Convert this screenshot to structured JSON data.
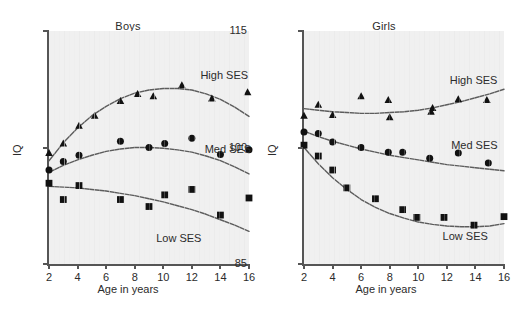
{
  "figure": {
    "background": "#ffffff",
    "plot_background": "#f0f0f0",
    "axis_color": "#555555",
    "curve_color": "#5c5c5c",
    "marker_color": "#111111"
  },
  "chart_data": [
    {
      "type": "scatter",
      "title": "Boys",
      "xlabel": "Age in years",
      "ylabel": "IQ",
      "xlim": [
        2,
        16
      ],
      "ylim": [
        85,
        115
      ],
      "xticks": [
        2,
        4,
        6,
        8,
        10,
        12,
        14,
        16
      ],
      "yticks": [
        85,
        100,
        115
      ],
      "grid": false,
      "legend_position": "inline-right",
      "series": [
        {
          "name": "High SES",
          "marker": "triangle",
          "label": "High SES",
          "label_x": 12.6,
          "label_y": 109.2,
          "points": [
            {
              "x": 2.0,
              "y": 99.3
            },
            {
              "x": 3.0,
              "y": 100.5
            },
            {
              "x": 4.1,
              "y": 102.8
            },
            {
              "x": 5.2,
              "y": 104.1
            },
            {
              "x": 7.0,
              "y": 106.0
            },
            {
              "x": 8.2,
              "y": 106.9
            },
            {
              "x": 9.3,
              "y": 106.6
            },
            {
              "x": 11.3,
              "y": 108.0
            },
            {
              "x": 13.4,
              "y": 106.3
            },
            {
              "x": 15.9,
              "y": 107.1
            }
          ],
          "fit": [
            {
              "x": 2.0,
              "y": 98.3
            },
            {
              "x": 3.0,
              "y": 100.6
            },
            {
              "x": 4.0,
              "y": 102.5
            },
            {
              "x": 5.0,
              "y": 104.1
            },
            {
              "x": 6.0,
              "y": 105.3
            },
            {
              "x": 7.0,
              "y": 106.3
            },
            {
              "x": 8.0,
              "y": 107.0
            },
            {
              "x": 9.0,
              "y": 107.4
            },
            {
              "x": 10.0,
              "y": 107.6
            },
            {
              "x": 11.0,
              "y": 107.6
            },
            {
              "x": 12.0,
              "y": 107.4
            },
            {
              "x": 13.0,
              "y": 106.9
            },
            {
              "x": 14.0,
              "y": 106.2
            },
            {
              "x": 15.0,
              "y": 105.2
            },
            {
              "x": 16.0,
              "y": 104.0
            }
          ]
        },
        {
          "name": "Med SES",
          "marker": "circle",
          "label": "Med SES",
          "label_x": 12.9,
          "label_y": 99.7,
          "points": [
            {
              "x": 2.0,
              "y": 97.1
            },
            {
              "x": 3.0,
              "y": 98.2
            },
            {
              "x": 4.1,
              "y": 99.0
            },
            {
              "x": 7.0,
              "y": 100.8
            },
            {
              "x": 9.0,
              "y": 100.0
            },
            {
              "x": 10.1,
              "y": 100.5
            },
            {
              "x": 12.0,
              "y": 101.2
            },
            {
              "x": 14.0,
              "y": 99.1
            },
            {
              "x": 16.0,
              "y": 99.7
            }
          ],
          "fit": [
            {
              "x": 2.0,
              "y": 96.8
            },
            {
              "x": 3.0,
              "y": 97.7
            },
            {
              "x": 4.0,
              "y": 98.4
            },
            {
              "x": 5.0,
              "y": 99.0
            },
            {
              "x": 6.0,
              "y": 99.5
            },
            {
              "x": 7.0,
              "y": 99.8
            },
            {
              "x": 8.0,
              "y": 100.0
            },
            {
              "x": 9.0,
              "y": 100.0
            },
            {
              "x": 10.0,
              "y": 99.9
            },
            {
              "x": 11.0,
              "y": 99.7
            },
            {
              "x": 12.0,
              "y": 99.4
            },
            {
              "x": 13.0,
              "y": 98.9
            },
            {
              "x": 14.0,
              "y": 98.3
            },
            {
              "x": 15.0,
              "y": 97.5
            },
            {
              "x": 16.0,
              "y": 96.6
            }
          ]
        },
        {
          "name": "Low SES",
          "marker": "square",
          "label": "Low SES",
          "label_x": 9.5,
          "label_y": 88.2,
          "points": [
            {
              "x": 2.0,
              "y": 95.4
            },
            {
              "x": 3.0,
              "y": 93.3
            },
            {
              "x": 4.1,
              "y": 95.1
            },
            {
              "x": 7.0,
              "y": 93.3
            },
            {
              "x": 9.0,
              "y": 92.4
            },
            {
              "x": 10.1,
              "y": 93.9
            },
            {
              "x": 12.0,
              "y": 94.6
            },
            {
              "x": 14.0,
              "y": 91.3
            },
            {
              "x": 16.0,
              "y": 93.5
            }
          ],
          "fit": [
            {
              "x": 2.0,
              "y": 95.0
            },
            {
              "x": 3.0,
              "y": 94.9
            },
            {
              "x": 4.0,
              "y": 94.8
            },
            {
              "x": 5.0,
              "y": 94.6
            },
            {
              "x": 6.0,
              "y": 94.4
            },
            {
              "x": 7.0,
              "y": 94.1
            },
            {
              "x": 8.0,
              "y": 93.8
            },
            {
              "x": 9.0,
              "y": 93.4
            },
            {
              "x": 10.0,
              "y": 93.0
            },
            {
              "x": 11.0,
              "y": 92.5
            },
            {
              "x": 12.0,
              "y": 92.0
            },
            {
              "x": 13.0,
              "y": 91.4
            },
            {
              "x": 14.0,
              "y": 90.7
            },
            {
              "x": 15.0,
              "y": 90.0
            },
            {
              "x": 16.0,
              "y": 89.2
            }
          ]
        }
      ]
    },
    {
      "type": "scatter",
      "title": "Girls",
      "xlabel": "Age in years",
      "ylabel": "IQ",
      "xlim": [
        2,
        16
      ],
      "ylim": [
        85,
        115
      ],
      "xticks": [
        2,
        4,
        6,
        8,
        10,
        12,
        14,
        16
      ],
      "yticks": [
        85,
        100,
        115
      ],
      "grid": false,
      "legend_position": "inline-right",
      "series": [
        {
          "name": "High SES",
          "marker": "triangle",
          "label": "High SES",
          "label_x": 12.2,
          "label_y": 108.6,
          "points": [
            {
              "x": 2.0,
              "y": 104.1
            },
            {
              "x": 3.0,
              "y": 105.5
            },
            {
              "x": 4.0,
              "y": 104.2
            },
            {
              "x": 6.0,
              "y": 106.6
            },
            {
              "x": 7.9,
              "y": 106.1
            },
            {
              "x": 8.0,
              "y": 103.9
            },
            {
              "x": 10.9,
              "y": 104.6
            },
            {
              "x": 11.0,
              "y": 105.1
            },
            {
              "x": 12.8,
              "y": 106.2
            },
            {
              "x": 14.8,
              "y": 106.1
            }
          ],
          "fit": [
            {
              "x": 2.0,
              "y": 105.0
            },
            {
              "x": 3.0,
              "y": 104.8
            },
            {
              "x": 4.0,
              "y": 104.6
            },
            {
              "x": 5.0,
              "y": 104.5
            },
            {
              "x": 6.0,
              "y": 104.4
            },
            {
              "x": 7.0,
              "y": 104.4
            },
            {
              "x": 8.0,
              "y": 104.5
            },
            {
              "x": 9.0,
              "y": 104.6
            },
            {
              "x": 10.0,
              "y": 104.8
            },
            {
              "x": 11.0,
              "y": 105.1
            },
            {
              "x": 12.0,
              "y": 105.5
            },
            {
              "x": 13.0,
              "y": 105.9
            },
            {
              "x": 14.0,
              "y": 106.4
            },
            {
              "x": 15.0,
              "y": 106.9
            },
            {
              "x": 16.0,
              "y": 107.5
            }
          ]
        },
        {
          "name": "Med SES",
          "marker": "circle",
          "label": "Med SES",
          "label_x": 12.3,
          "label_y": 100.2,
          "points": [
            {
              "x": 2.0,
              "y": 102.0
            },
            {
              "x": 3.0,
              "y": 101.8
            },
            {
              "x": 4.0,
              "y": 100.7
            },
            {
              "x": 6.0,
              "y": 100.0
            },
            {
              "x": 7.9,
              "y": 99.4
            },
            {
              "x": 8.9,
              "y": 99.4
            },
            {
              "x": 10.8,
              "y": 98.6
            },
            {
              "x": 12.8,
              "y": 99.3
            },
            {
              "x": 14.9,
              "y": 98.0
            }
          ],
          "fit": [
            {
              "x": 2.0,
              "y": 102.1
            },
            {
              "x": 3.0,
              "y": 101.4
            },
            {
              "x": 4.0,
              "y": 100.8
            },
            {
              "x": 5.0,
              "y": 100.3
            },
            {
              "x": 6.0,
              "y": 99.8
            },
            {
              "x": 7.0,
              "y": 99.4
            },
            {
              "x": 8.0,
              "y": 99.0
            },
            {
              "x": 9.0,
              "y": 98.7
            },
            {
              "x": 10.0,
              "y": 98.4
            },
            {
              "x": 11.0,
              "y": 98.1
            },
            {
              "x": 12.0,
              "y": 97.8
            },
            {
              "x": 13.0,
              "y": 97.6
            },
            {
              "x": 14.0,
              "y": 97.4
            },
            {
              "x": 15.0,
              "y": 97.2
            },
            {
              "x": 16.0,
              "y": 97.0
            }
          ]
        },
        {
          "name": "Low SES",
          "marker": "square",
          "label": "Low SES",
          "label_x": 11.7,
          "label_y": 88.5,
          "points": [
            {
              "x": 2.0,
              "y": 100.3
            },
            {
              "x": 3.0,
              "y": 98.9
            },
            {
              "x": 4.0,
              "y": 97.1
            },
            {
              "x": 5.0,
              "y": 94.8
            },
            {
              "x": 7.0,
              "y": 93.4
            },
            {
              "x": 8.9,
              "y": 92.0
            },
            {
              "x": 9.9,
              "y": 91.0
            },
            {
              "x": 11.8,
              "y": 91.0
            },
            {
              "x": 13.9,
              "y": 90.0
            },
            {
              "x": 16.0,
              "y": 91.1
            }
          ],
          "fit": [
            {
              "x": 2.0,
              "y": 100.0
            },
            {
              "x": 3.0,
              "y": 97.9
            },
            {
              "x": 4.0,
              "y": 96.1
            },
            {
              "x": 5.0,
              "y": 94.6
            },
            {
              "x": 6.0,
              "y": 93.3
            },
            {
              "x": 7.0,
              "y": 92.3
            },
            {
              "x": 8.0,
              "y": 91.5
            },
            {
              "x": 9.0,
              "y": 90.9
            },
            {
              "x": 10.0,
              "y": 90.4
            },
            {
              "x": 11.0,
              "y": 90.1
            },
            {
              "x": 12.0,
              "y": 89.9
            },
            {
              "x": 13.0,
              "y": 89.8
            },
            {
              "x": 14.0,
              "y": 89.8
            },
            {
              "x": 15.0,
              "y": 89.9
            },
            {
              "x": 16.0,
              "y": 90.2
            }
          ]
        }
      ]
    }
  ]
}
